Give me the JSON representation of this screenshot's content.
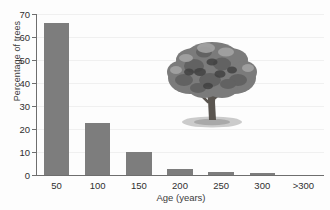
{
  "chart_data": {
    "type": "bar",
    "title": "",
    "xlabel": "Age (years)",
    "ylabel": "Percentage of trees",
    "categories": [
      "50",
      "100",
      "150",
      "200",
      "250",
      "300",
      ">300"
    ],
    "values": [
      66,
      22.5,
      10,
      2.5,
      1.5,
      0.7,
      0
    ],
    "ylim": [
      0,
      70
    ],
    "yticks": [
      0,
      10,
      20,
      30,
      40,
      50,
      60,
      70
    ],
    "ytick_labels": [
      "0",
      "10",
      "20",
      "30",
      "40",
      "50",
      "60",
      "70"
    ],
    "grid": true,
    "legend": "none",
    "bar_color": "#7d7d7d",
    "axis_color": "#6e6e6e",
    "grid_color": "#f0f0f0",
    "background_color": "#fdfdfd"
  },
  "annotations": {
    "tree_image_alt": "tree-illustration"
  }
}
